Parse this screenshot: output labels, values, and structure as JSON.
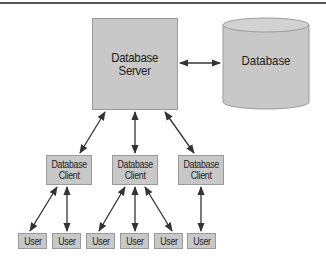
{
  "diagram": {
    "type": "client-server architecture",
    "colors": {
      "box_fill": "#c8c8c8",
      "box_border": "#9a9a9a",
      "arrow": "#333333",
      "text": "#222222"
    },
    "server": {
      "label": "Database\nServer"
    },
    "database": {
      "label": "Database",
      "shape": "cylinder"
    },
    "clients": [
      {
        "label": "Database\nClient"
      },
      {
        "label": "Database\nClient"
      },
      {
        "label": "Database\nClient"
      }
    ],
    "users": [
      {
        "label": "User",
        "client": 0
      },
      {
        "label": "User",
        "client": 0
      },
      {
        "label": "User",
        "client": 1
      },
      {
        "label": "User",
        "client": 1
      },
      {
        "label": "User",
        "client": 1
      },
      {
        "label": "User",
        "client": 2
      }
    ],
    "edges": [
      {
        "from": "server",
        "to": "database",
        "bidirectional": true
      },
      {
        "from": "server",
        "to": "client-0",
        "bidirectional": true
      },
      {
        "from": "server",
        "to": "client-1",
        "bidirectional": true
      },
      {
        "from": "server",
        "to": "client-2",
        "bidirectional": true
      },
      {
        "from": "client-0",
        "to": "user-0",
        "bidirectional": true
      },
      {
        "from": "client-0",
        "to": "user-1",
        "bidirectional": true
      },
      {
        "from": "client-1",
        "to": "user-2",
        "bidirectional": true
      },
      {
        "from": "client-1",
        "to": "user-3",
        "bidirectional": true
      },
      {
        "from": "client-1",
        "to": "user-4",
        "bidirectional": true
      },
      {
        "from": "client-2",
        "to": "user-5",
        "bidirectional": true
      }
    ]
  }
}
